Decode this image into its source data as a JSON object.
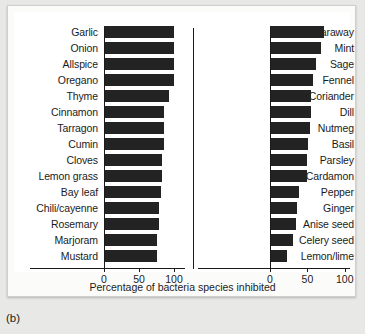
{
  "caption": "(b)",
  "chart_data": {
    "type": "bar",
    "title": "",
    "xlabel": "Percentage of bacteria species inhibited",
    "ylabel": "",
    "xlim": [
      0,
      110
    ],
    "orientation": "horizontal",
    "grid": false,
    "legend": null,
    "tick_labels": [
      "0",
      "50",
      "100"
    ],
    "ticks": [
      0,
      50,
      100
    ],
    "panels": [
      {
        "name": "left-panel",
        "categories": [
          "Garlic",
          "Onion",
          "Allspice",
          "Oregano",
          "Thyme",
          "Cinnamon",
          "Tarragon",
          "Cumin",
          "Cloves",
          "Lemon grass",
          "Bay leaf",
          "Chili/cayenne",
          "Rosemary",
          "Marjoram",
          "Mustard"
        ],
        "values": [
          100,
          100,
          100,
          100,
          93,
          86,
          86,
          86,
          83,
          83,
          81,
          78,
          78,
          75,
          75
        ]
      },
      {
        "name": "right-panel",
        "categories": [
          "Caraway",
          "Mint",
          "Sage",
          "Fennel",
          "Coriander",
          "Dill",
          "Nutmeg",
          "Basil",
          "Parsley",
          "Cardamon",
          "Pepper",
          "Ginger",
          "Anise seed",
          "Celery seed",
          "Lemon/lime"
        ],
        "values": [
          72,
          68,
          62,
          57,
          55,
          55,
          53,
          51,
          50,
          50,
          39,
          36,
          35,
          31,
          23
        ]
      }
    ]
  }
}
